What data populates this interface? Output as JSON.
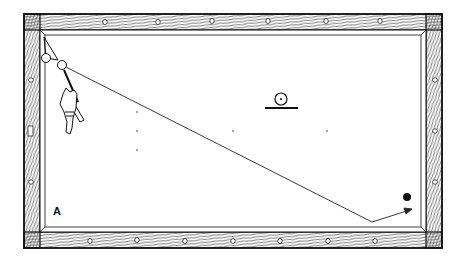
{
  "figure": {
    "type": "billiard-table-shot-diagram",
    "label": "A",
    "colors": {
      "ink": "#1a1a1a",
      "background": "#ffffff",
      "rail_fill": "#ffffff"
    }
  },
  "table": {
    "outer": {
      "x": 24,
      "y": 14,
      "w": 418,
      "h": 234
    },
    "inner": {
      "x": 40,
      "y": 30,
      "w": 386,
      "h": 202
    },
    "top_diamonds_x": [
      105,
      158,
      212,
      268,
      326,
      380
    ],
    "bottom_diamonds_x": [
      90,
      137,
      185,
      233,
      280,
      328,
      375
    ],
    "side_diamonds_y": [
      80,
      131,
      182
    ]
  },
  "balls": {
    "object_ball": {
      "cx": 46,
      "cy": 58,
      "r": 4.5
    },
    "cue_ball": {
      "cx": 62,
      "cy": 65,
      "r": 4.5
    },
    "black_ball": {
      "cx": 407,
      "cy": 197,
      "r": 4
    }
  },
  "path": {
    "start": [
      62,
      65
    ],
    "bank_point": [
      372,
      222
    ],
    "end_arrow": [
      412,
      209
    ]
  },
  "spot_symbol": {
    "cx": 281,
    "cy": 99,
    "r": 6,
    "base_y": 108,
    "base_x1": 265,
    "base_x2": 298
  },
  "spot_dots": [
    [
      137,
      112
    ],
    [
      137,
      131
    ],
    [
      137,
      150
    ],
    [
      233,
      131
    ],
    [
      327,
      131
    ]
  ]
}
